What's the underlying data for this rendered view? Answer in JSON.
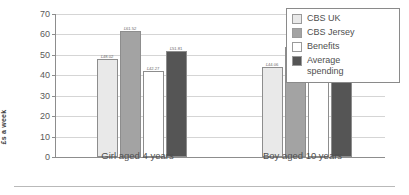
{
  "chart_data": {
    "type": "bar",
    "title": "",
    "xlabel": "",
    "ylabel": "£s a week",
    "ylim": [
      0,
      70
    ],
    "yticks": [
      0,
      10,
      20,
      30,
      40,
      50,
      60,
      70
    ],
    "ytick_labels": [
      "0",
      "10",
      "20",
      "30",
      "40",
      "50",
      "60",
      "70"
    ],
    "grid": true,
    "legend_position": "top-right",
    "categories": [
      "Girl aged 4 years",
      "Boy aged 10 years"
    ],
    "series": [
      {
        "name": "CBS UK",
        "color": "#e9e9e9",
        "values": [
          48.02,
          44.06
        ],
        "labels": [
          "£48.02",
          "£44.06"
        ]
      },
      {
        "name": "CBS Jersey",
        "color": "#a3a3a3",
        "values": [
          61.52,
          53.76
        ],
        "labels": [
          "£61.52",
          "£53.76"
        ]
      },
      {
        "name": "Benefits",
        "color": "#ffffff",
        "values": [
          42.27,
          47.72
        ],
        "labels": [
          "£42.27",
          "£47.72"
        ]
      },
      {
        "name": "Average spending",
        "color": "#555555",
        "values": [
          51.81,
          56.11
        ],
        "labels": [
          "£51.81",
          "£56.11"
        ]
      }
    ]
  },
  "legend": {
    "entries": [
      {
        "label": "CBS UK"
      },
      {
        "label": "CBS Jersey"
      },
      {
        "label": "Benefits"
      },
      {
        "label": "Average\nspending"
      }
    ]
  },
  "colors": {
    "cbs_uk": "#e9e9e9",
    "cbs_jersey": "#a3a3a3",
    "benefits": "#ffffff",
    "average_spending": "#555555",
    "axis": "#8d8d8d",
    "grid": "#d5d5d5",
    "text": "#4f4f4f"
  }
}
